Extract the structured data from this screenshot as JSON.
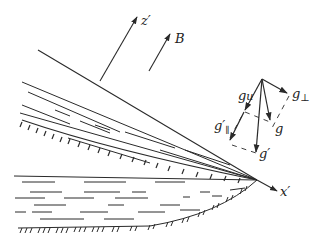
{
  "diagram": {
    "colors": {
      "line": "#2a2a2a",
      "background": "#ffffff"
    },
    "labels": {
      "z_axis": "z′",
      "x_axis": "x′",
      "field": "B",
      "g_parallel_u": "g",
      "g_parallel_u_sub": "u",
      "g_perp": "g",
      "g_perp_sub": "⊥",
      "g": "g",
      "g_prime": "g′",
      "g_prime_parallel": "g′",
      "g_prime_parallel_sub": "∥"
    }
  }
}
